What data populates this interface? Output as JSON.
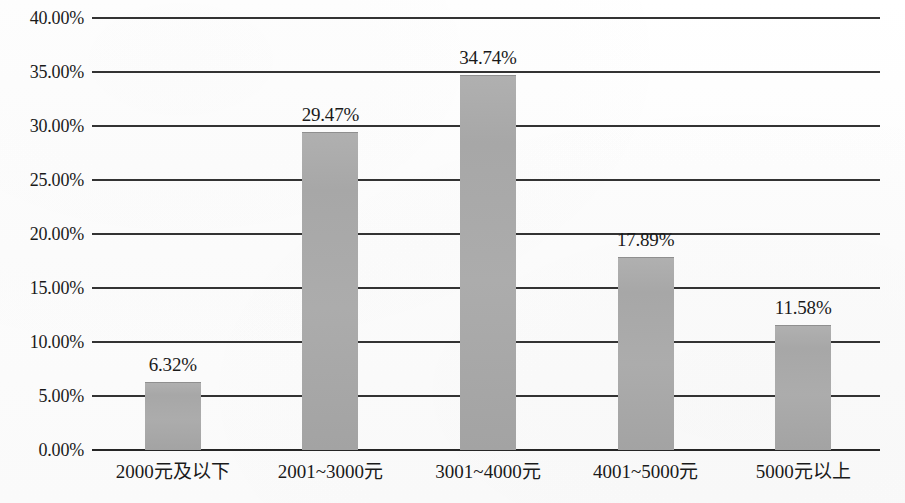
{
  "chart_data": {
    "type": "bar",
    "title": "",
    "subtitle": "",
    "xlabel": "",
    "ylabel": "",
    "categories": [
      "2000元及以下",
      "2001~3000元",
      "3001~4000元",
      "4001~5000元",
      "5000元以上"
    ],
    "values": [
      6.32,
      29.47,
      34.74,
      17.89,
      11.58
    ],
    "value_labels": [
      "6.32%",
      "29.47%",
      "34.74%",
      "17.89%",
      "11.58%"
    ],
    "ylim": [
      0,
      40
    ],
    "ytick_values": [
      0,
      5,
      10,
      15,
      20,
      25,
      30,
      35,
      40
    ],
    "ytick_labels": [
      "0.00%",
      "5.00%",
      "10.00%",
      "15.00%",
      "20.00%",
      "25.00%",
      "30.00%",
      "35.00%",
      "40.00%"
    ],
    "grid": true,
    "grid_axis": "y",
    "legend": false,
    "legend_position": "none",
    "series": [
      {
        "name": "占比",
        "values": [
          6.32,
          29.47,
          34.74,
          17.89,
          11.58
        ]
      }
    ],
    "colors": {
      "bar_fill": "#a8a8a8",
      "bar_edge": "#8f8f8f",
      "gridline": "#333333",
      "axis": "#262626",
      "text": "#1a1a1a",
      "background": "#fdfdfd"
    }
  }
}
